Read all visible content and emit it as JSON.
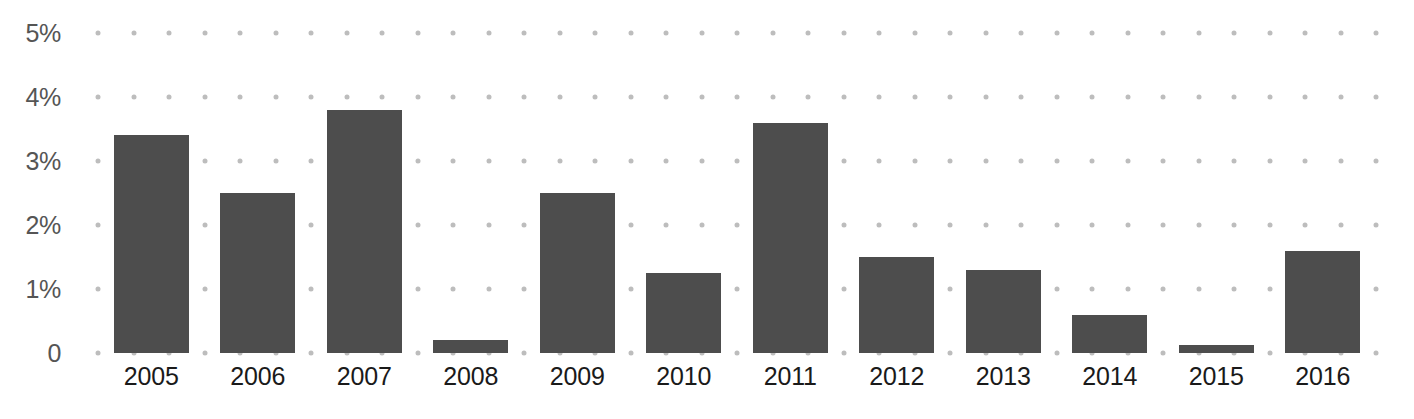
{
  "chart_data": {
    "type": "bar",
    "title": "",
    "subtitle": "",
    "xlabel": "",
    "ylabel": "",
    "categories": [
      "2005",
      "2006",
      "2007",
      "2008",
      "2009",
      "2010",
      "2011",
      "2012",
      "2013",
      "2014",
      "2015",
      "2016"
    ],
    "values": [
      3.4,
      2.5,
      3.8,
      0.2,
      2.5,
      1.25,
      3.6,
      1.5,
      1.3,
      0.6,
      0.13,
      1.6
    ],
    "value_unit": "%",
    "ylim": [
      0,
      5
    ],
    "y_ticks": [
      0,
      1,
      2,
      3,
      4,
      5
    ],
    "y_tick_labels": [
      "0",
      "1%",
      "2%",
      "3%",
      "4%",
      "5%"
    ],
    "grid": "dotted",
    "grid_position": "horizontal-dot-rows",
    "legend": "none",
    "series": [
      {
        "name": "",
        "color": "#4d4d4d",
        "values": [
          3.4,
          2.5,
          3.8,
          0.2,
          2.5,
          1.25,
          3.6,
          1.5,
          1.3,
          0.6,
          0.13,
          1.6
        ]
      }
    ],
    "colors": {
      "bar": "#4d4d4d",
      "grid_dot": "#bdbdbd",
      "y_tick_label": "#555555",
      "x_tick_label": "#1a1a1a",
      "background": "#ffffff"
    }
  }
}
